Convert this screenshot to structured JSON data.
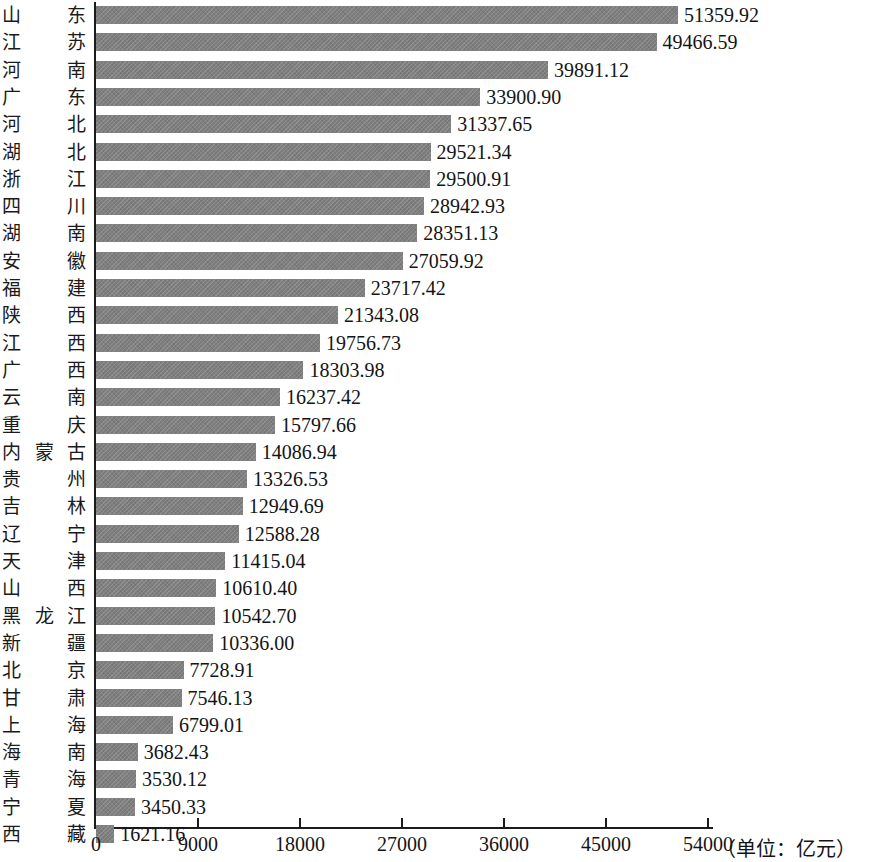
{
  "chart_data": {
    "type": "bar",
    "orientation": "horizontal",
    "title": "",
    "subtitle": "",
    "xlabel": "",
    "ylabel": "",
    "unit_note": "（单位：亿元）",
    "xlim": [
      0,
      54000
    ],
    "xticks": [
      0,
      9000,
      18000,
      27000,
      36000,
      45000,
      54000
    ],
    "xtick_labels": [
      "0",
      "9000",
      "18000",
      "27000",
      "36000",
      "45000",
      "54000"
    ],
    "grid": false,
    "legend": null,
    "bar_color": "#7f7f7f",
    "axis_color": "#1b1b1b",
    "categories": [
      "山东",
      "江苏",
      "河南",
      "广东",
      "河北",
      "湖北",
      "浙江",
      "四川",
      "湖南",
      "安徽",
      "福建",
      "陕西",
      "江西",
      "广西",
      "云南",
      "重庆",
      "内蒙古",
      "贵州",
      "吉林",
      "辽宁",
      "天津",
      "山西",
      "黑龙江",
      "新疆",
      "北京",
      "甘肃",
      "上海",
      "海南",
      "青海",
      "宁夏",
      "西藏"
    ],
    "values": [
      51359.92,
      49466.59,
      39891.12,
      33900.9,
      31337.65,
      29521.34,
      29500.91,
      28942.93,
      28351.13,
      27059.92,
      23717.42,
      21343.08,
      19756.73,
      18303.98,
      16237.42,
      15797.66,
      14086.94,
      13326.53,
      12949.69,
      12588.28,
      11415.04,
      10610.4,
      10542.7,
      10336.0,
      7728.91,
      7546.13,
      6799.01,
      3682.43,
      3530.12,
      3450.33,
      1621.16
    ],
    "value_labels": [
      "51359.92",
      "49466.59",
      "39891.12",
      "33900.90",
      "31337.65",
      "29521.34",
      "29500.91",
      "28942.93",
      "28351.13",
      "27059.92",
      "23717.42",
      "21343.08",
      "19756.73",
      "18303.98",
      "16237.42",
      "15797.66",
      "14086.94",
      "13326.53",
      "12949.69",
      "12588.28",
      "11415.04",
      "10610.40",
      "10542.70",
      "10336.00",
      "7728.91",
      "7546.13",
      "6799.01",
      "3682.43",
      "3530.12",
      "3450.33",
      "1621.16"
    ]
  }
}
